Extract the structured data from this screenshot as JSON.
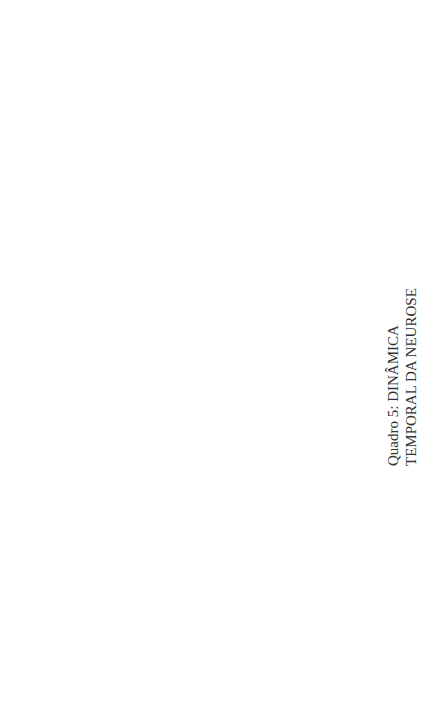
{
  "title": {
    "line1": "Quadro 5: DINÂMICA",
    "line2": "TEMPORAL DA NEUROSE"
  },
  "colors": {
    "dark": "#a9a9a9",
    "light": "#dcdcdc",
    "edge": "#8c8c8c",
    "text": "#1a1a1a"
  },
  "nodes": [
    {
      "id": "fundo1",
      "lines": [
        "FUNDO DE",
        "POSSIBILIDADES"
      ],
      "x": 98,
      "y": 42,
      "r": 14,
      "shade": "dark"
    },
    {
      "id": "evento1",
      "lines": [
        "EVENTO",
        "1"
      ],
      "x": 172,
      "y": 107,
      "r": 15,
      "shade": "dark"
    },
    {
      "id": "fundoassim1",
      "lines": [
        "FUNDO",
        "ASSIMILADO"
      ],
      "x": 172,
      "y": 177,
      "r": 13,
      "shade": "light"
    },
    {
      "id": "fundo2",
      "lines": [
        "FUNDO DE",
        "POSSIBILIDADES"
      ],
      "x": 196,
      "y": 42,
      "r": 14,
      "shade": "light"
    },
    {
      "id": "evento2",
      "lines": [
        "EVENTO",
        "2"
      ],
      "x": 272,
      "y": 107,
      "r": 15,
      "shade": "light"
    },
    {
      "id": "sit1",
      "lines": [
        "SITUAÇÃO",
        "INACABADA"
      ],
      "x": 272,
      "y": 177,
      "r": 13,
      "shade": "dark"
    },
    {
      "id": "fundoassim2",
      "lines": [
        "FUNDO",
        "ASSIMILADO"
      ],
      "x": 272,
      "y": 243,
      "r": 13,
      "shade": "dark"
    },
    {
      "id": "inib_delib",
      "lines": [
        "INIBIÇÃO",
        "DELIBERADA"
      ],
      "x": 378,
      "y": 107,
      "r": 15,
      "shade": "dark"
    },
    {
      "id": "inib_rep1",
      "lines": [
        "INIBIÇÃO",
        "REPRIMIDA"
      ],
      "x": 378,
      "y": 177,
      "r": 13,
      "shade": "light"
    },
    {
      "id": "sit2",
      "lines": [
        "SITUAÇÃO",
        "INACABADA"
      ],
      "x": 378,
      "y": 243,
      "r": 13,
      "shade": "light"
    },
    {
      "id": "fundoassim3",
      "lines": [
        "FUNDO",
        "ASSIMILADO"
      ],
      "x": 378,
      "y": 310,
      "r": 13,
      "shade": "light"
    },
    {
      "id": "inib_rep2",
      "lines": [
        "INIBIÇÃO",
        "REPRIMIDA"
      ],
      "x": 478,
      "y": 243,
      "r": 13,
      "shade": "dark"
    },
    {
      "id": "sit3",
      "lines": [
        "SITUAÇÃO",
        "INACABADA"
      ],
      "x": 478,
      "y": 310,
      "r": 13,
      "shade": "dark"
    },
    {
      "id": "fundoassim4",
      "lines": [
        "FUNDO",
        "ASSIMILADO"
      ],
      "x": 478,
      "y": 378,
      "r": 13,
      "shade": "dark"
    },
    {
      "id": "inib_rep3",
      "lines": [
        "INIBIÇÃO",
        "REPRIMIDA"
      ],
      "x": 578,
      "y": 310,
      "r": 13,
      "shade": "light"
    },
    {
      "id": "sit4",
      "lines": [
        "SITUAÇÃO",
        "INACABADA"
      ],
      "x": 578,
      "y": 378,
      "r": 13,
      "shade": "light"
    },
    {
      "id": "inib_rep4",
      "lines": [
        "INIBIÇÃO",
        "REPRIMIDA"
      ],
      "x": 670,
      "y": 378,
      "r": 13,
      "shade": "dark"
    },
    {
      "id": "histeria",
      "lines": [
        "O: APEGO",
        "M: PARALISIA",
        "E",
        "DESSENSIBILIZAÇÃO",
        "S: HISTERIA",
        "REGRESSÃO"
      ],
      "x": 450,
      "y": 110,
      "r": 14,
      "shade": "light"
    },
    {
      "id": "vazio1",
      "lines": [
        "VAZIO"
      ],
      "x": 545,
      "y": 177,
      "r": 12,
      "shade": "dark"
    },
    {
      "id": "vazio2",
      "lines": [
        "VAZIO"
      ],
      "x": 545,
      "y": 243,
      "r": 12,
      "shade": "light"
    },
    {
      "id": "vazio3",
      "lines": [
        "VAZIO"
      ],
      "x": 545,
      "y": 310,
      "r": 12,
      "shade": "dark"
    },
    {
      "id": "vazio4",
      "lines": [
        "VAZIO"
      ],
      "x": 545,
      "y": 378,
      "r": 12,
      "shade": "light"
    },
    {
      "id": "masoquismo",
      "lines": [
        "O: INVERSÃO DO",
        "AFETO",
        "M: IDENTIFICAÇÃO",
        "S: MASOQUISMO"
      ],
      "x": 617,
      "y": 110,
      "r": 15,
      "shade": "dark"
    },
    {
      "id": "fundo_adapt1",
      "lines": [
        "FUNDO DE",
        "POSSIBILIDADES",
        "ADAPTADAS"
      ],
      "x": 400,
      "y": 42,
      "r": 13,
      "shade": "dark"
    },
    {
      "id": "fantasia",
      "lines": [
        "O: REPÚDIO À",
        "EMOÇÃO",
        "M: PROVOCAÇÃO",
        "PASSIVA",
        "S: FANTASIA"
      ],
      "x": 400,
      "y": 110,
      "r": 14,
      "shade": "light"
    }
  ],
  "diagram": {
    "fundos_top": [
      {
        "lines": [
          "FUNDO DE",
          "POSSIBILIDADES"
        ],
        "x": 106,
        "y": 44,
        "shade": "dark"
      },
      {
        "lines": [
          "FUNDO DE",
          "POSSIBILIDADES"
        ],
        "x": 201,
        "y": 44,
        "shade": "light"
      },
      {
        "lines": [
          "FUNDO DE",
          "POSSIBILIDADES",
          "ADAPTADAS"
        ],
        "x": 401,
        "y": 44,
        "shade": "dark"
      },
      {
        "lines": [
          "FUNDO DE",
          "POSSIBILIDADES",
          "ADAPTADAS"
        ],
        "x": 491,
        "y": 44,
        "shade": "light"
      },
      {
        "lines": [
          "FUNDO DE",
          "POSSIBILIDADES",
          "ADAPTADAS"
        ],
        "x": 546,
        "y": 44,
        "shade": "dark",
        "arc": "RETROFLEXÃO"
      },
      {
        "lines": [
          "FUNDO DE",
          "POSSIBILIDADES",
          "ADAPTADAS"
        ],
        "x": 626,
        "y": 44,
        "shade": "light",
        "arc": "EGOTISMO"
      }
    ],
    "row1": [
      {
        "lines": [
          "EVENTO",
          "1"
        ],
        "x": 536,
        "y": 108,
        "shade": "dark",
        "big": true
      },
      {
        "lines": [
          "EVENTO",
          "2"
        ],
        "x": 603,
        "y": 108,
        "shade": "light",
        "big": true
      }
    ]
  }
}
